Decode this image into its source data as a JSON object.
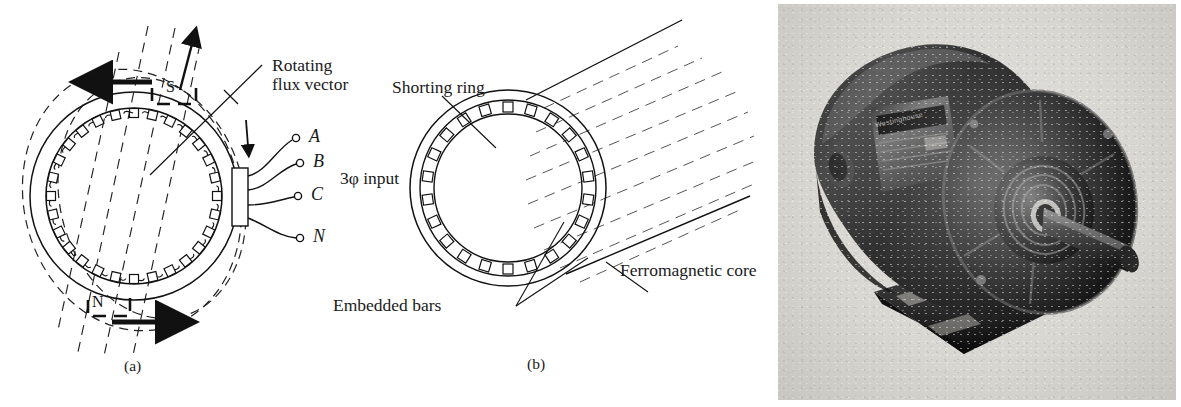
{
  "figure": {
    "panels": [
      {
        "id": "a",
        "caption": "(a)",
        "name": "stator-cross-section",
        "labels": {
          "flux_vector_line1": "Rotating",
          "flux_vector_line2": "flux vector",
          "three_phase_input": "3φ input"
        },
        "poles": {
          "south": "S",
          "north": "N"
        },
        "terminals": [
          {
            "id": "A",
            "label": "A"
          },
          {
            "id": "B",
            "label": "B"
          },
          {
            "id": "C",
            "label": "C"
          },
          {
            "id": "N",
            "label": "N"
          }
        ],
        "slot_count": 28
      },
      {
        "id": "b",
        "caption": "(b)",
        "name": "squirrel-cage-rotor",
        "labels": {
          "shorting_ring": "Shorting ring",
          "embedded_bars": "Embedded bars",
          "ferromagnetic_core": "Ferromagnetic core"
        },
        "bar_count": 22
      },
      {
        "id": "photo",
        "name": "induction-motor-photograph",
        "nameplate_text": "Westinghouse"
      }
    ]
  },
  "colors": {
    "ink": "#111111",
    "line": "#1a1a1a",
    "dashed": "#2a2a2a",
    "photo_background": "#d9d7d2",
    "motor_body_dark": "#1c1c1c",
    "motor_body_mid": "#3a3a3a",
    "motor_highlight": "#8e8e8e"
  }
}
